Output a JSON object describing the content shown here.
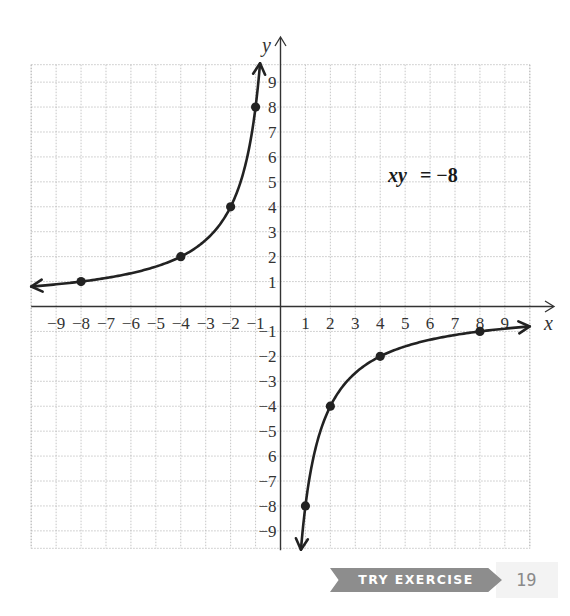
{
  "chart_data": {
    "type": "line",
    "title": "",
    "equation_label": "xy = −8",
    "equation_parts": {
      "lhs": "xy",
      "rhs": "= −8"
    },
    "xlabel": "x",
    "ylabel": "y",
    "xlim": [
      -10,
      10
    ],
    "ylim": [
      -9.7,
      9.7
    ],
    "grid": true,
    "x_tick_labels": [
      "−9",
      "−8",
      "−7",
      "−6",
      "−5",
      "−4",
      "−3",
      "−2",
      "−1",
      "1",
      "2",
      "3",
      "4",
      "5",
      "6",
      "7",
      "8",
      "9"
    ],
    "x_tick_values": [
      -9,
      -8,
      -7,
      -6,
      -5,
      -4,
      -3,
      -2,
      -1,
      1,
      2,
      3,
      4,
      5,
      6,
      7,
      8,
      9
    ],
    "y_tick_labels": [
      "9",
      "8",
      "7",
      "6",
      "5",
      "4",
      "3",
      "2",
      "1",
      "−1",
      "−2",
      "−3",
      "−4",
      "−5",
      "6",
      "−7",
      "−8",
      "−9"
    ],
    "y_tick_values": [
      9,
      8,
      7,
      6,
      5,
      4,
      3,
      2,
      1,
      -1,
      -2,
      -3,
      -4,
      -5,
      -6,
      -7,
      -8,
      -9
    ],
    "series": [
      {
        "name": "xy = -8 (branch in quadrant II)",
        "function": "y = -8/x",
        "x_range": [
          -10,
          -0.82
        ],
        "marked_points": [
          [
            -8,
            1
          ],
          [
            -4,
            2
          ],
          [
            -2,
            4
          ],
          [
            -1,
            8
          ]
        ],
        "arrows": [
          "left",
          "up"
        ]
      },
      {
        "name": "xy = -8 (branch in quadrant IV)",
        "function": "y = -8/x",
        "x_range": [
          0.82,
          10
        ],
        "marked_points": [
          [
            1,
            -8
          ],
          [
            2,
            -4
          ],
          [
            4,
            -2
          ],
          [
            8,
            -1
          ]
        ],
        "arrows": [
          "down",
          "right"
        ]
      }
    ],
    "legend": null
  },
  "footer": {
    "badge_label": "TRY EXERCISE",
    "exercise_number": "19"
  },
  "colors": {
    "curve": "#222222",
    "grid": "#b8b8b8",
    "axis": "#333333",
    "badge": "#8d8d8d",
    "badge_text": "#ffffff",
    "exercise_number": "#8a8a8a"
  }
}
